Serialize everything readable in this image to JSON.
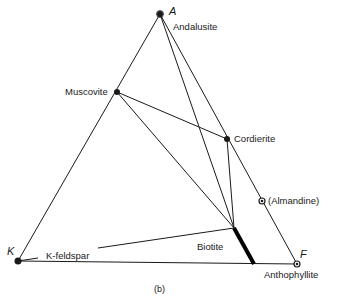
{
  "diagram": {
    "caption": "(b)",
    "vertices": {
      "A": {
        "label": "A",
        "x": 160,
        "y": 14
      },
      "K": {
        "label": "K",
        "x": 18,
        "y": 261
      },
      "F": {
        "label": "F",
        "x": 297,
        "y": 264
      }
    },
    "phases": [
      {
        "id": "andalusite",
        "label": "Andalusite",
        "x": 160,
        "y": 14
      },
      {
        "id": "muscovite",
        "label": "Muscovite",
        "x": 117,
        "y": 92
      },
      {
        "id": "cordierite",
        "label": "Cordierite",
        "x": 227,
        "y": 139
      },
      {
        "id": "almandine",
        "label": "(Almandine)",
        "x": 262,
        "y": 201
      },
      {
        "id": "biotite",
        "label": "Biotite",
        "x1": 234,
        "y1": 228,
        "x2": 254,
        "y2": 264
      },
      {
        "id": "k-feldspar",
        "label": "K-feldspar",
        "x": 18,
        "y": 261
      },
      {
        "id": "anthophyllite",
        "label": "Anthophyllite",
        "x": 297,
        "y": 264
      }
    ],
    "tie_lines": [
      {
        "from": "muscovite",
        "to": "cordierite"
      },
      {
        "from": "muscovite",
        "to": "biotite"
      },
      {
        "from": "andalusite",
        "to": "biotite"
      },
      {
        "from": "cordierite",
        "to": "biotite"
      },
      {
        "from": "k-feldspar",
        "to": "biotite"
      }
    ],
    "colors": {
      "line": "#1a1a1a",
      "background": "#ffffff"
    }
  }
}
